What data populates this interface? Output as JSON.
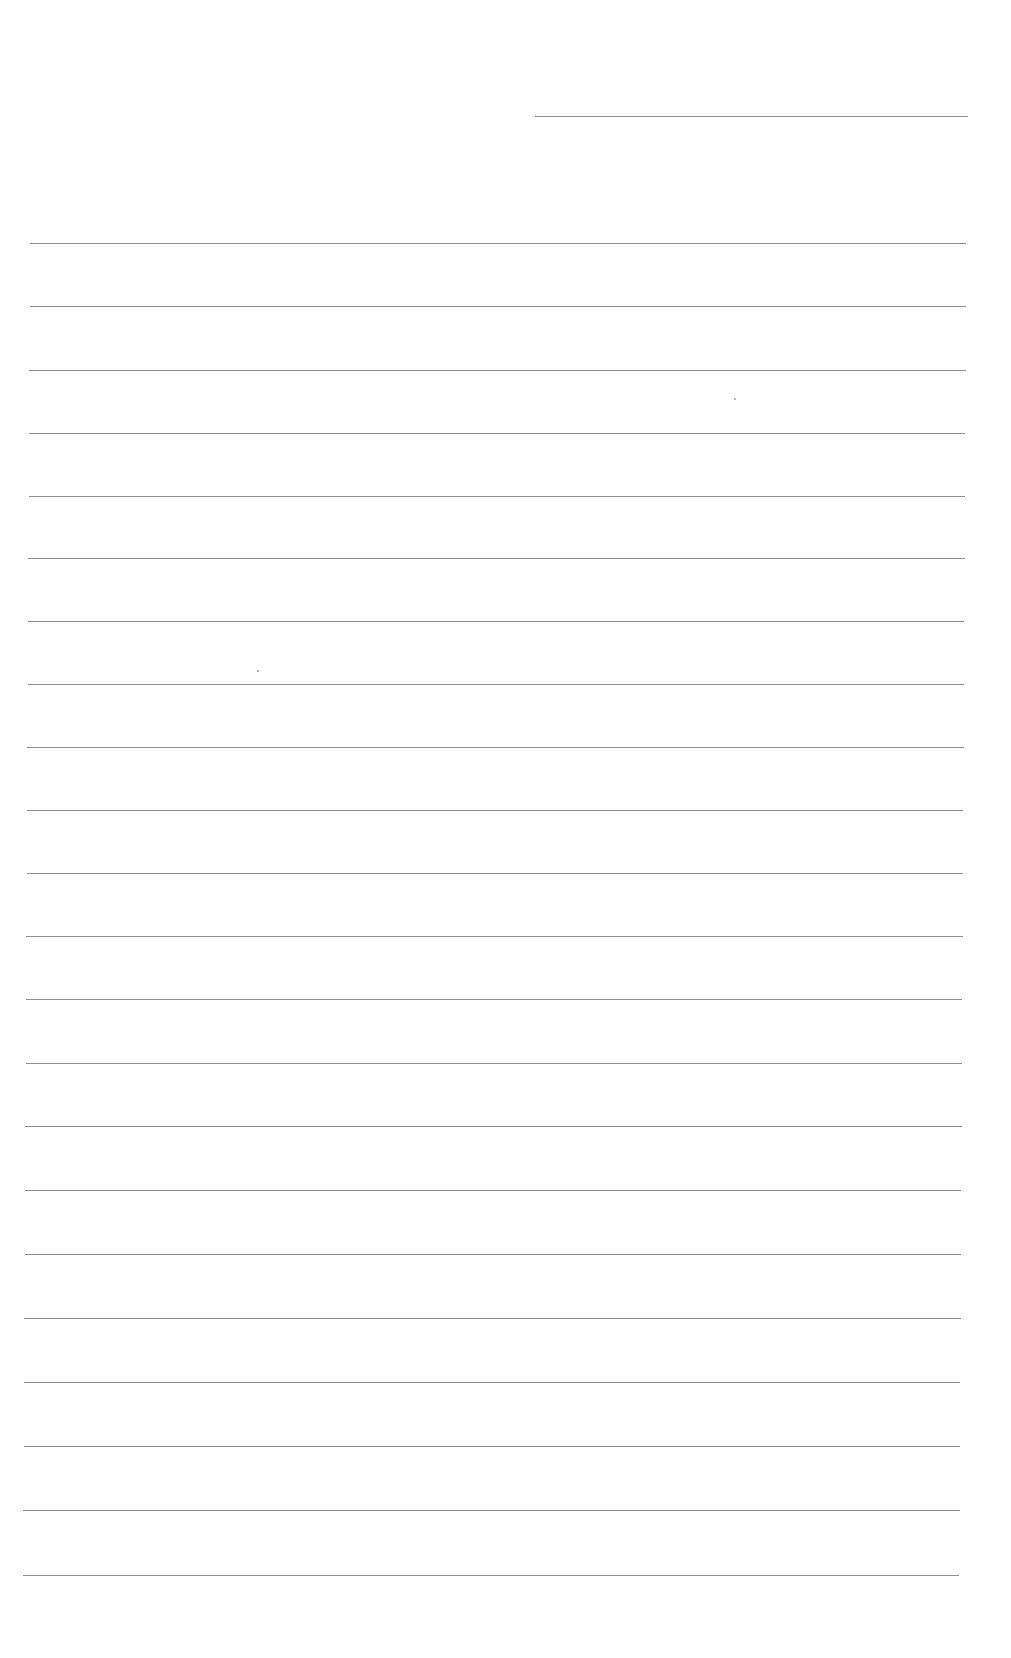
{
  "page": {
    "type": "ruled-paper",
    "background_color": "#ffffff",
    "line_color": "#8e8e8e",
    "header_line": {
      "x1": 535,
      "x2": 968,
      "y": 116
    },
    "rules": [
      {
        "y": 243,
        "x1": 30,
        "x2": 966
      },
      {
        "y": 306,
        "x1": 30,
        "x2": 966
      },
      {
        "y": 370,
        "x1": 29,
        "x2": 966
      },
      {
        "y": 433,
        "x1": 29,
        "x2": 965
      },
      {
        "y": 496,
        "x1": 29,
        "x2": 965
      },
      {
        "y": 558,
        "x1": 28,
        "x2": 965
      },
      {
        "y": 621,
        "x1": 28,
        "x2": 964
      },
      {
        "y": 684,
        "x1": 28,
        "x2": 964
      },
      {
        "y": 747,
        "x1": 27,
        "x2": 964
      },
      {
        "y": 810,
        "x1": 27,
        "x2": 963
      },
      {
        "y": 873,
        "x1": 27,
        "x2": 963
      },
      {
        "y": 936,
        "x1": 26,
        "x2": 963
      },
      {
        "y": 999,
        "x1": 26,
        "x2": 962
      },
      {
        "y": 1063,
        "x1": 26,
        "x2": 962
      },
      {
        "y": 1126,
        "x1": 25,
        "x2": 962
      },
      {
        "y": 1190,
        "x1": 25,
        "x2": 961
      },
      {
        "y": 1254,
        "x1": 25,
        "x2": 961
      },
      {
        "y": 1318,
        "x1": 24,
        "x2": 961
      },
      {
        "y": 1382,
        "x1": 24,
        "x2": 960
      },
      {
        "y": 1446,
        "x1": 24,
        "x2": 960
      },
      {
        "y": 1510,
        "x1": 23,
        "x2": 960
      },
      {
        "y": 1575,
        "x1": 23,
        "x2": 959
      }
    ],
    "specks": [
      {
        "x": 734,
        "y": 398
      },
      {
        "x": 257,
        "y": 670
      }
    ]
  }
}
